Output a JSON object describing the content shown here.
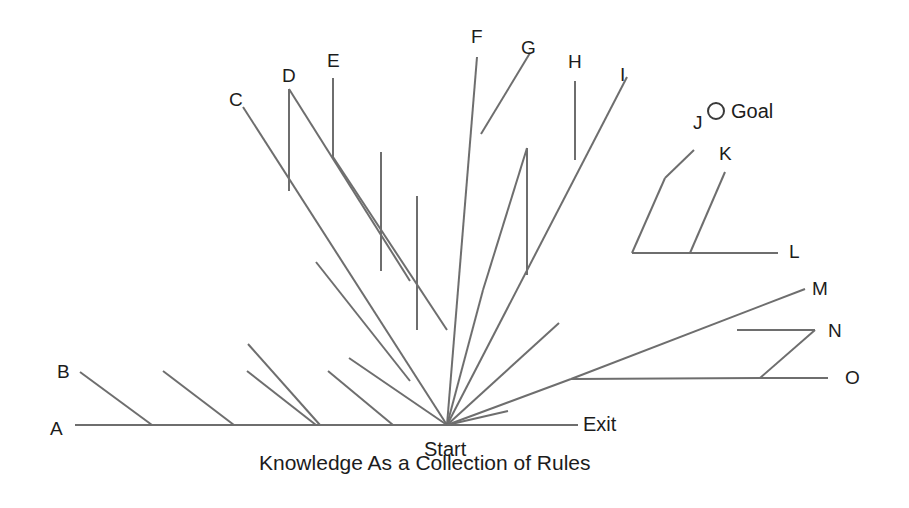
{
  "diagram": {
    "title": "Knowledge As a Collection of Rules",
    "title_pos": {
      "x": 259,
      "y": 452
    },
    "start_label": "Start",
    "start_pos": {
      "x": 424,
      "y": 439
    },
    "exit_label": "Exit",
    "exit_pos": {
      "x": 583,
      "y": 414
    },
    "goal_label": "Goal",
    "goal_pos": {
      "x": 731,
      "y": 101
    },
    "goal_marker": {
      "cx": 716,
      "cy": 111,
      "r": 8
    },
    "start_node": {
      "x": 447,
      "y": 425
    },
    "stroke_color": "#6e6e6e",
    "text_color": "#1c1c1c",
    "background_color": "#ffffff",
    "canvas": {
      "width": 909,
      "height": 508
    },
    "node_labels": [
      {
        "id": "A",
        "text": "A",
        "x": 50,
        "y": 419
      },
      {
        "id": "B",
        "text": "B",
        "x": 57,
        "y": 362
      },
      {
        "id": "C",
        "text": "C",
        "x": 229,
        "y": 90
      },
      {
        "id": "D",
        "text": "D",
        "x": 282,
        "y": 66
      },
      {
        "id": "E",
        "text": "E",
        "x": 327,
        "y": 51
      },
      {
        "id": "F",
        "text": "F",
        "x": 471,
        "y": 27
      },
      {
        "id": "G",
        "text": "G",
        "x": 521,
        "y": 38
      },
      {
        "id": "H",
        "text": "H",
        "x": 568,
        "y": 52
      },
      {
        "id": "I",
        "text": "I",
        "x": 620,
        "y": 65
      },
      {
        "id": "J",
        "text": "J",
        "x": 693,
        "y": 113
      },
      {
        "id": "K",
        "text": "K",
        "x": 719,
        "y": 144
      },
      {
        "id": "L",
        "text": "L",
        "x": 789,
        "y": 242
      },
      {
        "id": "M",
        "text": "M",
        "x": 812,
        "y": 279
      },
      {
        "id": "N",
        "text": "N",
        "x": 828,
        "y": 321
      },
      {
        "id": "O",
        "text": "O",
        "x": 845,
        "y": 368
      }
    ],
    "paths": [
      {
        "name": "branch-A-baseline-left",
        "points": "75,425 447,425"
      },
      {
        "name": "branch-exit-baseline-right",
        "points": "447,425 578,425"
      },
      {
        "name": "branch-B-trunk",
        "points": "80,372 152,425"
      },
      {
        "name": "spur-B-1",
        "points": "163,371 234,425"
      },
      {
        "name": "spur-B-2",
        "points": "247,371 316,425"
      },
      {
        "name": "spur-B-3",
        "points": "328,371 393,425"
      },
      {
        "name": "branch-C-trunk",
        "points": "243,107 447,425"
      },
      {
        "name": "branch-C-stub-D",
        "points": "289,89 289,191"
      },
      {
        "name": "branch-D-diagonal",
        "points": "289,89 410,281"
      },
      {
        "name": "branch-E-stub",
        "points": "333,78 333,157"
      },
      {
        "name": "branch-E-diagonal",
        "points": "333,157 447,330"
      },
      {
        "name": "branch-E-stub-lower",
        "points": "381,152 381,271"
      },
      {
        "name": "branch-inner-left-stub",
        "points": "417,196 417,330"
      },
      {
        "name": "spur-inner-left-1",
        "points": "248,344 320,425"
      },
      {
        "name": "spur-inner-left-2",
        "points": "316,262 410,381"
      },
      {
        "name": "spur-inner-left-3",
        "points": "349,358 447,425"
      },
      {
        "name": "branch-F-trunk",
        "points": "477,57 447,425"
      },
      {
        "name": "branch-G-diagonal-upper",
        "points": "530,53 481,134"
      },
      {
        "name": "branch-G-stub",
        "points": "527,148 527,275"
      },
      {
        "name": "branch-G-diagonal-lower",
        "points": "527,148 483,290"
      },
      {
        "name": "branch-G-tail",
        "points": "483,290 447,425"
      },
      {
        "name": "branch-I-trunk",
        "points": "627,77 447,425"
      },
      {
        "name": "branch-H-stub",
        "points": "575,81 575,160"
      },
      {
        "name": "branch-inner-right-1",
        "points": "559,323 447,425"
      },
      {
        "name": "branch-inner-right-2",
        "points": "508,411 447,425"
      },
      {
        "name": "branch-L-horizontal",
        "points": "632,253 778,253"
      },
      {
        "name": "branch-J-lower",
        "points": "632,253 665,178"
      },
      {
        "name": "branch-J-upper",
        "points": "665,178 694,150"
      },
      {
        "name": "branch-K-diagonal",
        "points": "690,253 725,172"
      },
      {
        "name": "branch-M-trunk",
        "points": "571,379 805,289"
      },
      {
        "name": "branch-N-horizontal",
        "points": "737,330 815,330"
      },
      {
        "name": "branch-N-diagonal",
        "points": "815,330 760,378"
      },
      {
        "name": "branch-O-horizontal",
        "points": "760,378 828,378"
      },
      {
        "name": "branch-O-trunk",
        "points": "571,379 760,378"
      },
      {
        "name": "branch-lower-right-trunk",
        "points": "447,425 571,379"
      }
    ]
  }
}
